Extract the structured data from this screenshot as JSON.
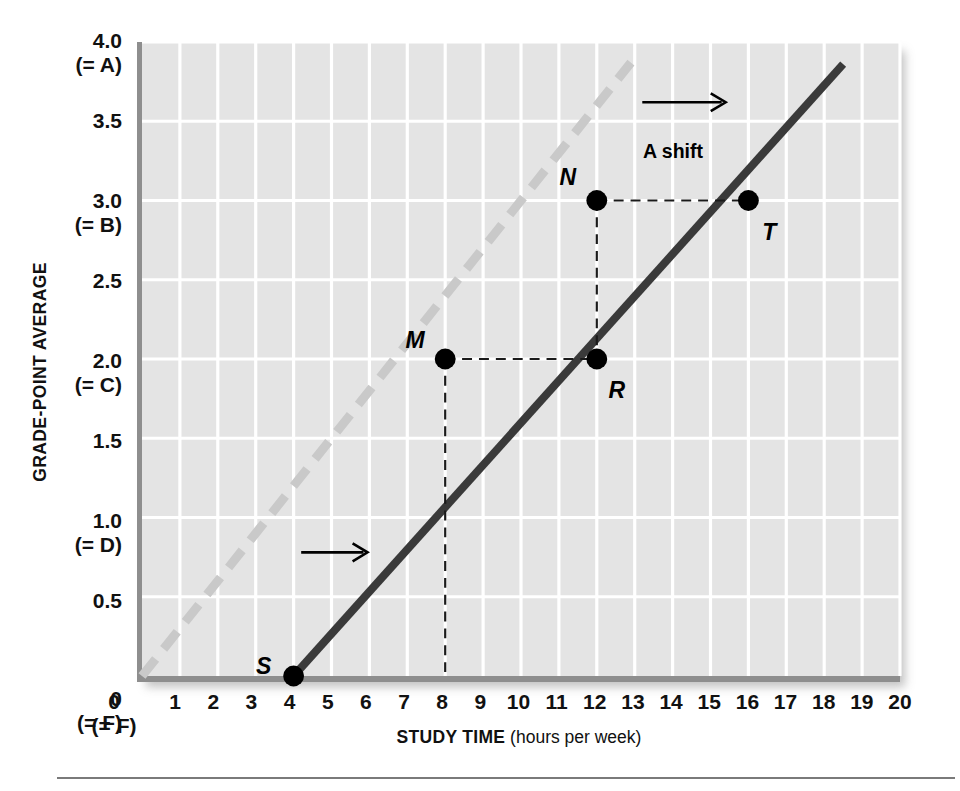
{
  "chart_data": {
    "type": "line",
    "title": "",
    "xlabel_bold": "STUDY TIME",
    "xlabel_rest": " (hours per week)",
    "ylabel": "GRADE-POINT AVERAGE",
    "xlim": [
      0,
      20
    ],
    "ylim": [
      0,
      4.0
    ],
    "grid": true,
    "legend": "none",
    "plot_bgcolor": "#e4e4e4",
    "gridline_color": "#ffffff",
    "xticks": [
      {
        "value": 0,
        "label": "0",
        "sublabel": "(= F)"
      },
      {
        "value": 1,
        "label": "1",
        "sublabel": ""
      },
      {
        "value": 2,
        "label": "2",
        "sublabel": ""
      },
      {
        "value": 3,
        "label": "3",
        "sublabel": ""
      },
      {
        "value": 4,
        "label": "4",
        "sublabel": ""
      },
      {
        "value": 5,
        "label": "5",
        "sublabel": ""
      },
      {
        "value": 6,
        "label": "6",
        "sublabel": ""
      },
      {
        "value": 7,
        "label": "7",
        "sublabel": ""
      },
      {
        "value": 8,
        "label": "8",
        "sublabel": ""
      },
      {
        "value": 9,
        "label": "9",
        "sublabel": ""
      },
      {
        "value": 10,
        "label": "10",
        "sublabel": ""
      },
      {
        "value": 11,
        "label": "11",
        "sublabel": ""
      },
      {
        "value": 12,
        "label": "12",
        "sublabel": ""
      },
      {
        "value": 13,
        "label": "13",
        "sublabel": ""
      },
      {
        "value": 14,
        "label": "14",
        "sublabel": ""
      },
      {
        "value": 15,
        "label": "15",
        "sublabel": ""
      },
      {
        "value": 16,
        "label": "16",
        "sublabel": ""
      },
      {
        "value": 17,
        "label": "17",
        "sublabel": ""
      },
      {
        "value": 18,
        "label": "18",
        "sublabel": ""
      },
      {
        "value": 19,
        "label": "19",
        "sublabel": ""
      },
      {
        "value": 20,
        "label": "20",
        "sublabel": ""
      }
    ],
    "yticks": [
      {
        "value": 4.0,
        "label": "4.0",
        "sublabel": "(= A)"
      },
      {
        "value": 3.5,
        "label": "3.5",
        "sublabel": ""
      },
      {
        "value": 3.0,
        "label": "3.0",
        "sublabel": "(= B)"
      },
      {
        "value": 2.5,
        "label": "2.5",
        "sublabel": ""
      },
      {
        "value": 2.0,
        "label": "2.0",
        "sublabel": "(= C)"
      },
      {
        "value": 1.5,
        "label": "1.5",
        "sublabel": ""
      },
      {
        "value": 1.0,
        "label": "1.0",
        "sublabel": "(= D)"
      },
      {
        "value": 0.5,
        "label": "0.5",
        "sublabel": ""
      },
      {
        "value": 0.0,
        "label": "0",
        "sublabel": "(= F)"
      }
    ],
    "series": [
      {
        "name": "original-line",
        "style": "dashed",
        "color": "#c9c9c9",
        "width": 9,
        "x": [
          0,
          12.9
        ],
        "y": [
          0.0,
          3.87
        ],
        "comment": "shifted-left / original grade curve, long grey dashes"
      },
      {
        "name": "new-line",
        "style": "solid",
        "color": "#3a3a3a",
        "width": 8,
        "x": [
          4,
          18.5
        ],
        "y": [
          0.0,
          3.86
        ],
        "comment": "solid dark line starting at point S"
      }
    ],
    "points": [
      {
        "label": "S",
        "x": 4,
        "y": 0.0,
        "label_dx": -26,
        "label_dy": -16
      },
      {
        "label": "M",
        "x": 8,
        "y": 2.0,
        "label_dx": -27,
        "label_dy": -22
      },
      {
        "label": "N",
        "x": 12,
        "y": 3.0,
        "label_dx": -27,
        "label_dy": -25
      },
      {
        "label": "R",
        "x": 12,
        "y": 2.0,
        "label_dx": 22,
        "label_dy": 28
      },
      {
        "label": "T",
        "x": 16,
        "y": 3.0,
        "label_dx": 22,
        "label_dy": 30
      }
    ],
    "guide_lines": [
      {
        "name": "m-to-r-horizontal",
        "x1": 8,
        "y1": 2.0,
        "x2": 12,
        "y2": 2.0
      },
      {
        "name": "m-vertical-dropline",
        "x1": 8,
        "y1": 2.0,
        "x2": 8,
        "y2": 0.0
      },
      {
        "name": "n-to-t-horizontal",
        "x1": 12,
        "y1": 3.0,
        "x2": 16,
        "y2": 3.0
      },
      {
        "name": "n-to-r-vertical",
        "x1": 12,
        "y1": 3.0,
        "x2": 12,
        "y2": 2.0
      }
    ],
    "annotations": [
      {
        "name": "a-shift",
        "text": "A shift",
        "x": 14.05,
        "y": 3.32,
        "arrow": {
          "x1": 13.2,
          "y1": 3.62,
          "x2": 15.4,
          "y2": 3.62
        }
      },
      {
        "name": "lower-shift-arrow",
        "text": "",
        "arrow": {
          "x1": 4.2,
          "y1": 0.78,
          "x2": 5.95,
          "y2": 0.78
        }
      }
    ]
  }
}
